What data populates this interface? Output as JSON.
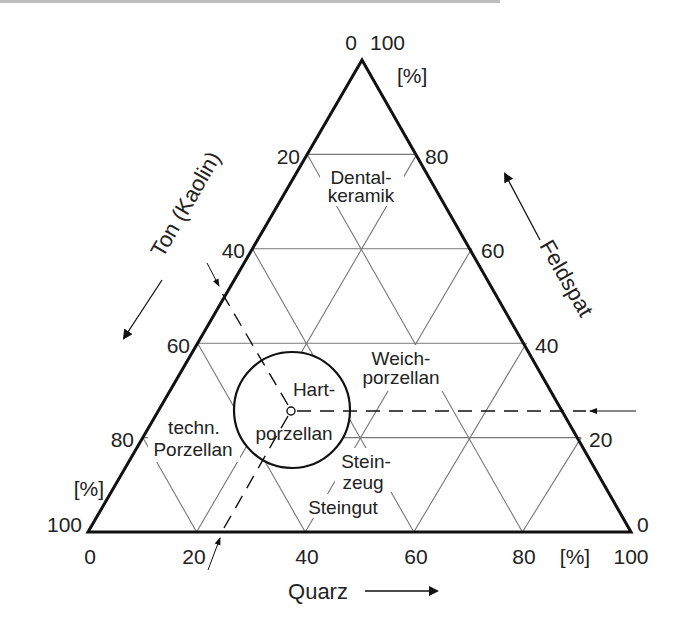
{
  "diagram": {
    "type": "ternary",
    "colors": {
      "line": "#111111",
      "grid": "#777777",
      "text": "#222222"
    },
    "vertices": {
      "top": [
        362,
        60
      ],
      "left": [
        88,
        532
      ],
      "right": [
        631,
        532
      ]
    },
    "unit": "[%]",
    "axes": {
      "ton": {
        "title": "Ton (Kaolin)",
        "ticks": [
          "0",
          "20",
          "40",
          "60",
          "80",
          "100"
        ],
        "unit": "[%]"
      },
      "feldspat": {
        "title": "Feldspat",
        "ticks": [
          "100",
          "80",
          "60",
          "40",
          "20",
          "0"
        ],
        "unit": "[%]"
      },
      "quarz": {
        "title": "Quarz",
        "ticks": [
          "0",
          "20",
          "40",
          "60",
          "80",
          "100"
        ],
        "unit": "[%]"
      }
    },
    "regions": {
      "dental": [
        "Dental-",
        "keramik"
      ],
      "weich": [
        "Weich-",
        "porzellan"
      ],
      "hart": [
        "Hart-",
        "porzellan"
      ],
      "techn": [
        "techn.",
        "Porzellan"
      ],
      "steinzeug": [
        "Stein-",
        "zeug"
      ],
      "steingut": "Steingut"
    },
    "highlight": {
      "label": "Hartporzellan",
      "example_point": {
        "quarz": 25,
        "feldspat": 25,
        "ton": 50
      }
    }
  }
}
